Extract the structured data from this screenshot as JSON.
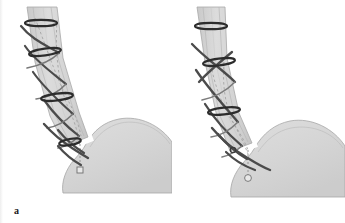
{
  "figure": {
    "type": "medical-illustration",
    "background_color": "#ffffff",
    "width": 345,
    "height": 223,
    "panel_count": 2
  },
  "palette": {
    "organ_fill": "#d7d7d7",
    "organ_fill_light": "#e2e2e2",
    "organ_outline": "#9a9a9a",
    "organ_outline_white": "#ffffff",
    "suture_dark": "#454545",
    "suture_mid": "#6e6e6e",
    "ring_dark": "#2e2e2e",
    "dashed_line": "#8c8c8c",
    "label_color": "#1a1a1a"
  },
  "panels": [
    {
      "id": "a",
      "label": "a",
      "caption": "",
      "anatomy": {
        "esophagus_label": "esophagus",
        "stomach_label": "stomach",
        "junction_label": "gastroesophageal junction"
      },
      "elements": {
        "ring_count": 4,
        "ring_description": "transverse elliptical suture rings",
        "helix_description": "tight-pitch helical suture winding around esophageal wall",
        "helix_turns": 3,
        "anchor_description": "dashed guide line with square terminal anchor below the junction",
        "anchor_marker": "square"
      }
    },
    {
      "id": "b",
      "label": "b",
      "caption": "",
      "anatomy": {
        "esophagus_label": "esophagus",
        "stomach_label": "stomach",
        "junction_label": "gastroesophageal junction"
      },
      "elements": {
        "ring_count": 3,
        "ring_description": "transverse elliptical suture rings",
        "helix_description": "wide-pitch helical suture with crossing limbs",
        "helix_turns": 2,
        "anchor_description": "dashed guide line with circular terminal anchor inside the gastric cardia",
        "anchor_marker": "circle"
      }
    }
  ]
}
